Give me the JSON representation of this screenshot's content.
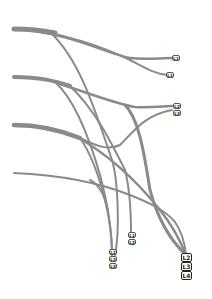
{
  "diagram": {
    "stroke_color": "#8a8a8a",
    "sources": [
      {
        "id": "s1",
        "y": 30
      },
      {
        "id": "s2",
        "y": 78
      },
      {
        "id": "s3",
        "y": 125
      },
      {
        "id": "s4",
        "y": 173
      }
    ],
    "targets": [
      {
        "id": "t1",
        "labels": [
          "L1"
        ]
      },
      {
        "id": "t2",
        "labels": [
          "L1"
        ]
      },
      {
        "id": "t3",
        "labels": [
          "L2",
          "L3"
        ]
      },
      {
        "id": "t4",
        "labels": [
          "L2",
          "L3",
          "L4"
        ]
      },
      {
        "id": "t5",
        "labels": [
          "L1",
          "L2"
        ]
      },
      {
        "id": "t6",
        "labels": [
          "L2",
          "L3",
          "L4"
        ]
      }
    ]
  }
}
